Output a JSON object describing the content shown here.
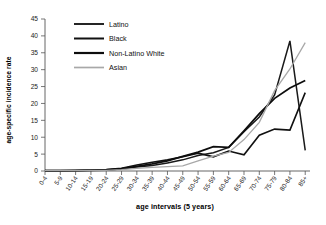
{
  "chart_data": {
    "type": "line",
    "title": "",
    "xlabel": "age intervals (5 years)",
    "ylabel": "age-specific incidence rate",
    "categories": [
      "0-4",
      "5-9",
      "10-14",
      "15-19",
      "20-24",
      "25-29",
      "30-34",
      "35-39",
      "40-44",
      "45-49",
      "50-54",
      "55-59",
      "60-64",
      "65-69",
      "70-74",
      "75-79",
      "80-84",
      "85+"
    ],
    "ylim": [
      0,
      45
    ],
    "ytick_step": 5,
    "yticks": [
      0,
      5,
      10,
      15,
      20,
      25,
      30,
      35,
      40,
      45
    ],
    "grid": false,
    "legend_position": "top-left",
    "series": [
      {
        "name": "Latino",
        "color": "#1a1a1a",
        "width": 1.5,
        "values": [
          0.1,
          0.1,
          0.1,
          0.2,
          0.3,
          0.6,
          1.2,
          1.6,
          2.4,
          3.3,
          4.6,
          5.4,
          7.0,
          11.6,
          16.0,
          22.5,
          38.5,
          6.1
        ]
      },
      {
        "name": "Black",
        "color": "#111111",
        "width": 1.6,
        "values": [
          0.1,
          0.1,
          0.2,
          0.3,
          0.4,
          0.8,
          1.8,
          2.6,
          3.3,
          4.2,
          5.3,
          4.2,
          5.9,
          4.8,
          10.6,
          12.4,
          12.1,
          23.2
        ]
      },
      {
        "name": "Non-Latino White",
        "color": "#0d0d0d",
        "width": 1.8,
        "values": [
          0.1,
          0.1,
          0.1,
          0.2,
          0.3,
          0.7,
          1.4,
          2.1,
          3.0,
          4.3,
          5.6,
          7.2,
          7.0,
          11.9,
          17.0,
          21.5,
          24.6,
          26.8
        ]
      },
      {
        "name": "Asian",
        "color": "#a8a8a8",
        "width": 1.3,
        "values": [
          0.1,
          0.1,
          0.1,
          0.2,
          0.2,
          0.4,
          0.8,
          1.1,
          1.3,
          1.5,
          3.0,
          4.4,
          5.5,
          9.3,
          14.4,
          23.8,
          30.2,
          38.0
        ]
      }
    ]
  },
  "legend": {
    "items": [
      {
        "label": "Latino"
      },
      {
        "label": "Black"
      },
      {
        "label": "Non-Latino White"
      },
      {
        "label": "Asian"
      }
    ]
  }
}
